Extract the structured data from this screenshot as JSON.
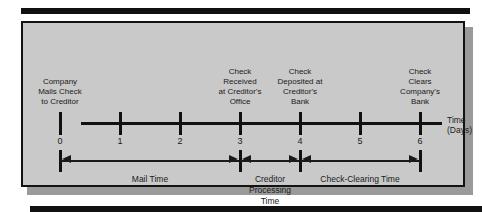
{
  "figure": {
    "type": "timeline",
    "background_color": "#c9c9c9",
    "ink_color": "#111111",
    "axis": {
      "title_line1": "Time",
      "title_line2": "(Days)",
      "ticks": [
        "0",
        "1",
        "2",
        "3",
        "4",
        "5",
        "6"
      ],
      "range": [
        0,
        6
      ]
    },
    "events": [
      {
        "day": 0,
        "label": "Company\nMails Check\nto Creditor"
      },
      {
        "day": 3,
        "label": "Check\nReceived\nat Creditor's\nOffice"
      },
      {
        "day": 4,
        "label": "Check\nDeposited at\nCreditor's\nBank"
      },
      {
        "day": 6,
        "label": "Check\nClears\nCompany's\nBank"
      }
    ],
    "spans": [
      {
        "from": 0,
        "to": 3,
        "label": "Mail Time"
      },
      {
        "from": 3,
        "to": 4,
        "label": "Creditor\nProcessing\nTime"
      },
      {
        "from": 4,
        "to": 6,
        "label": "Check-Clearing Time"
      }
    ]
  }
}
